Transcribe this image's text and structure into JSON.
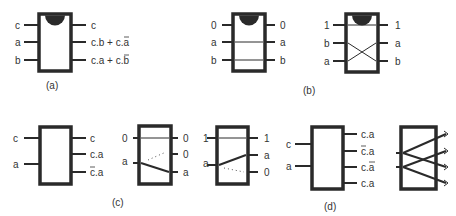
{
  "panels": {
    "a": {
      "caption": "(a)",
      "inputs": [
        "c",
        "a",
        "b"
      ],
      "outputs": [
        "c",
        "c.b + ",
        "c",
        ".a",
        "c.a + ",
        "c",
        ".b"
      ],
      "output_labels": [
        "c",
        "c.b + c̅.a",
        "c.a + c̅.b"
      ]
    },
    "b": {
      "caption": "(b)",
      "left_gate": {
        "inputs": [
          "0",
          "a",
          "b"
        ],
        "outputs": [
          "0",
          "a",
          "b"
        ]
      },
      "right_gate": {
        "inputs": [
          "1",
          "b",
          "a"
        ],
        "outputs": [
          "1",
          "a",
          "b"
        ]
      }
    },
    "c": {
      "caption": "(c)",
      "block": {
        "inputs": [
          "c",
          "a"
        ],
        "outputs": [
          "c",
          "c.a",
          "c̅.a"
        ]
      },
      "left_gate": {
        "inputs": [
          "0",
          "a"
        ],
        "outputs": [
          "0",
          "0",
          "a"
        ]
      },
      "right_gate": {
        "inputs": [
          "1",
          "a"
        ],
        "outputs": [
          "1",
          "a",
          "0"
        ]
      }
    },
    "d": {
      "caption": "(d)",
      "block": {
        "inputs": [
          "c",
          "a"
        ],
        "outputs": [
          "c.a",
          "c̅.a",
          "c.a̅",
          "c.a"
        ]
      },
      "crossover_outputs": 4
    }
  },
  "text": {
    "a_in_c": "c",
    "a_in_a": "a",
    "a_in_b": "b",
    "a_out_c": "c",
    "a_out_2_pre": "c.b + ",
    "a_out_2_bar": "c",
    "a_out_2_post": ".a",
    "a_out_3_pre": "c.a + ",
    "a_out_3_bar": "c",
    "a_out_3_post": ".b",
    "b1_in_0": "0",
    "b1_in_1": "a",
    "b1_in_2": "b",
    "b1_out_0": "0",
    "b1_out_1": "a",
    "b1_out_2": "b",
    "b2_in_0": "1",
    "b2_in_1": "b",
    "b2_in_2": "a",
    "b2_out_0": "1",
    "b2_out_1": "a",
    "b2_out_2": "b",
    "c0_in_0": "c",
    "c0_in_1": "a",
    "c0_out_0": "c",
    "c0_out_1": "c.a",
    "c0_out_2_bar": "c",
    "c0_out_2_post": ".a",
    "c1_in_0": "0",
    "c1_in_1": "a",
    "c1_out_0": "0",
    "c1_out_1": "0",
    "c1_out_2": "a",
    "c2_in_0": "1",
    "c2_in_1": "a",
    "c2_out_0": "1",
    "c2_out_1": "a",
    "c2_out_2": "0",
    "d0_in_0": "c",
    "d0_in_1": "a",
    "d0_out_0": "c.a",
    "d0_out_1_bar": "c",
    "d0_out_1_post": ".a",
    "d0_out_2_pre": "c.",
    "d0_out_2_bar": "a",
    "d0_out_3": "c.a",
    "cap_a": "(a)",
    "cap_b": "(b)",
    "cap_c": "(c)",
    "cap_d": "(d)"
  }
}
